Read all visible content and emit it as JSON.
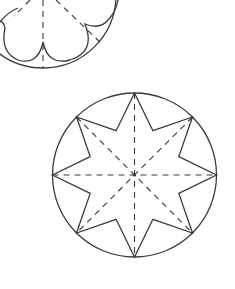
{
  "diagram": {
    "colors": {
      "line": "#3a3a3a",
      "background": "#ffffff"
    },
    "figures": [
      {
        "name": "scalloped-flower-partial",
        "circle": {
          "cx": 43,
          "cy": -5,
          "r": 73
        },
        "petal_cusps": [
          [
            5,
            28
          ],
          [
            43,
            42
          ],
          [
            85,
            24
          ]
        ],
        "fold_lines": "dashed radial lines at 0°, 45°, 90°, 135° (partially visible)"
      },
      {
        "name": "eight-pointed-star",
        "circle": {
          "cx": 134.5,
          "cy": 175,
          "r": 82
        },
        "points": 8,
        "outer_radius": 82,
        "inner_radius": 48,
        "fold_lines": "4 dashed lines through center connecting opposite star tips"
      }
    ]
  }
}
